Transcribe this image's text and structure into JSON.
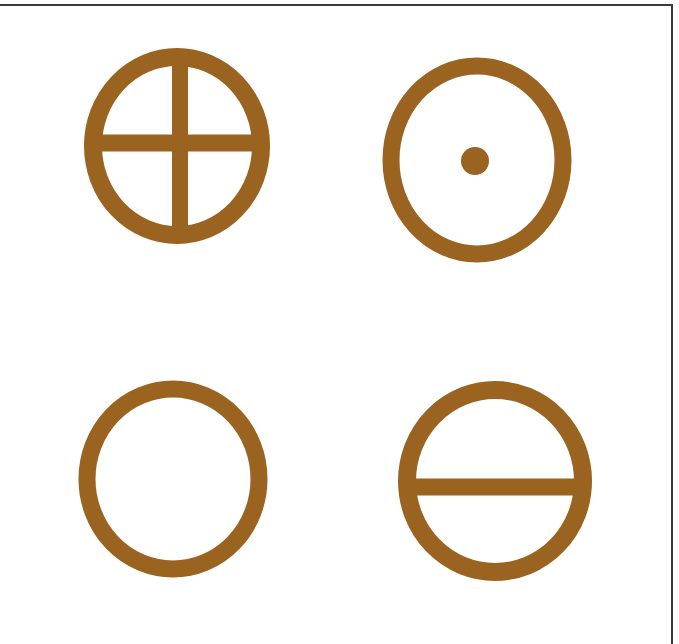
{
  "figure": {
    "background": "#ffffff",
    "border_color": "#3a3a3a",
    "symbol_color": "#9a6320",
    "symbols": [
      {
        "name": "circle-with-cross",
        "cx": 177,
        "cy": 146,
        "rx": 84,
        "ry": 89,
        "stroke": 18,
        "features": [
          "vertical-bar",
          "horizontal-bar"
        ],
        "vbar_x": 180,
        "hbar_y": 143
      },
      {
        "name": "circle-with-dot",
        "cx": 477,
        "cy": 160,
        "rx": 86,
        "ry": 94,
        "stroke": 17,
        "features": [
          "center-dot"
        ],
        "dot": {
          "cx": 475,
          "cy": 161,
          "r": 14
        }
      },
      {
        "name": "plain-circle",
        "cx": 173,
        "cy": 479,
        "rx": 86,
        "ry": 90,
        "stroke": 17,
        "features": []
      },
      {
        "name": "circle-with-horizontal-bar",
        "cx": 495,
        "cy": 481,
        "rx": 88,
        "ry": 91,
        "stroke": 18,
        "features": [
          "horizontal-bar"
        ],
        "hbar_y": 487
      }
    ]
  }
}
